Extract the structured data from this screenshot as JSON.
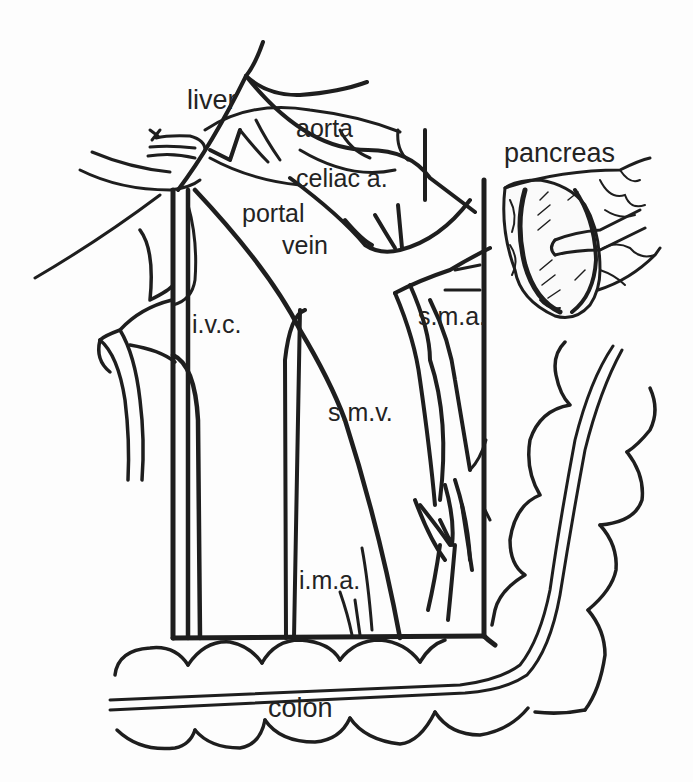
{
  "figure": {
    "type": "anatomical line drawing",
    "ink_color": "#1e1e1e",
    "background_color": "#fdfdfd"
  },
  "labels": {
    "liver": "liver",
    "aorta": "aorta",
    "celiac": "celiac a.",
    "portal_1": "portal",
    "portal_2": "vein",
    "pancreas": "pancreas",
    "ivc": "i.v.c.",
    "sma": "s.m.a.",
    "smv": "s.m.v.",
    "ima": "i.m.a.",
    "colon": "colon"
  }
}
